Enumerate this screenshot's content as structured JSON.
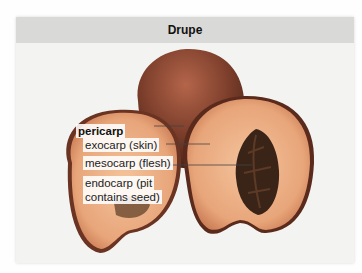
{
  "figure": {
    "title": "Drupe",
    "colors": {
      "title_bar": "#d9d9d7",
      "panel_bg": "#f3f3f1",
      "peach_skin": "#7a3d2a",
      "peach_flesh": "#e8a57a",
      "pit": "#3a2418"
    },
    "labels": {
      "group": "pericarp",
      "items": [
        {
          "text": "exocarp (skin)"
        },
        {
          "text": "mesocarp (flesh)"
        },
        {
          "text": "endocarp (pit\ncontains seed)",
          "line1": "endocarp (pit",
          "line2": "contains seed)"
        }
      ]
    }
  }
}
